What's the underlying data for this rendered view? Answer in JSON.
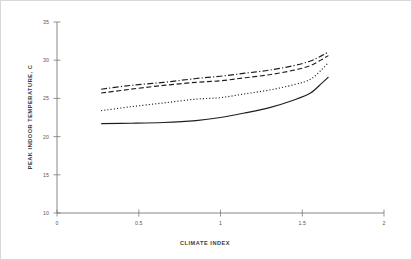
{
  "chart_data": {
    "type": "line",
    "title": "",
    "xlabel": "CLIMATE INDEX",
    "ylabel": "PEAK INDOOR TEMPERATURE, C",
    "xlim": [
      0,
      2
    ],
    "ylim": [
      10,
      35
    ],
    "xticks": [
      0,
      0.5,
      1,
      1.5,
      2
    ],
    "xticklabels": [
      "0",
      "0.5",
      "1",
      "1.5",
      "2"
    ],
    "yticks": [
      10,
      15,
      20,
      25,
      30,
      35
    ],
    "yticklabels": [
      "10",
      "15",
      "20",
      "25",
      "30",
      "35"
    ],
    "grid": false,
    "legend": "none",
    "x": [
      0.27,
      0.45,
      0.65,
      0.85,
      1.0,
      1.15,
      1.3,
      1.45,
      1.55,
      1.62,
      1.66
    ],
    "series": [
      {
        "name": "Series 1",
        "linestyle": "dash-dot",
        "color": "#1f1f1f",
        "values": [
          26.2,
          26.7,
          27.1,
          27.6,
          27.9,
          28.3,
          28.7,
          29.3,
          29.9,
          30.6,
          31.1
        ]
      },
      {
        "name": "Series 2",
        "linestyle": "dashed",
        "color": "#1f1f1f",
        "values": [
          25.7,
          26.2,
          26.7,
          27.1,
          27.3,
          27.7,
          28.1,
          28.7,
          29.3,
          30.1,
          30.6
        ]
      },
      {
        "name": "Series 3",
        "linestyle": "dotted",
        "color": "#1f1f1f",
        "values": [
          23.4,
          23.9,
          24.4,
          24.9,
          25.1,
          25.6,
          26.1,
          26.8,
          27.5,
          28.8,
          29.7
        ]
      },
      {
        "name": "Series 4",
        "linestyle": "solid",
        "color": "#1f1f1f",
        "values": [
          21.7,
          21.75,
          21.85,
          22.1,
          22.5,
          23.1,
          23.8,
          24.8,
          25.7,
          27.0,
          27.8
        ]
      }
    ]
  },
  "axes": {
    "x_title": "CLIMATE INDEX",
    "y_title": "PEAK INDOOR TEMPERATURE, C",
    "x_tick_0": "0",
    "x_tick_1": "0.5",
    "x_tick_2": "1",
    "x_tick_3": "1.5",
    "x_tick_4": "2",
    "y_tick_0": "10",
    "y_tick_1": "15",
    "y_tick_2": "20",
    "y_tick_3": "25",
    "y_tick_4": "30",
    "y_tick_5": "35"
  }
}
